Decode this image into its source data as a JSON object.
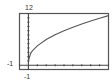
{
  "chart_data": {
    "type": "line",
    "title": "",
    "xlabel": "",
    "ylabel": "",
    "xlim": [
      -1,
      9
    ],
    "ylim": [
      -1,
      12
    ],
    "x_tick_step": 1,
    "y_tick_step": 1,
    "grid": false,
    "labels": {
      "ymax": "12",
      "ymin": "-1",
      "xmin": "-1"
    },
    "series": [
      {
        "name": "f(x)",
        "x": [
          0,
          0.25,
          0.5,
          1,
          2,
          3,
          4,
          5,
          6,
          7,
          8,
          9
        ],
        "y": [
          1,
          2.75,
          3.47,
          4.5,
          5.95,
          7.06,
          8,
          8.83,
          9.57,
          10.26,
          10.9,
          11.5
        ]
      }
    ],
    "colors": {
      "frame": "#555555",
      "axis": "#444444",
      "curve": "#555555"
    }
  }
}
